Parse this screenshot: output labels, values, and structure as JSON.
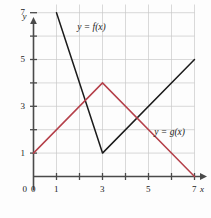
{
  "chart_data": {
    "type": "line",
    "title": "",
    "xlabel": "x",
    "ylabel": "y",
    "xlim": [
      0,
      7
    ],
    "ylim": [
      0,
      7
    ],
    "grid": true,
    "legend": "inline-labels",
    "x_ticks": [
      0,
      1,
      2,
      3,
      4,
      5,
      6,
      7
    ],
    "x_tick_labels": [
      "0",
      "1",
      "",
      "3",
      "",
      "5",
      "",
      "7"
    ],
    "y_ticks": [
      1,
      2,
      3,
      4,
      5,
      6,
      7
    ],
    "y_tick_labels": [
      "1",
      "",
      "3",
      "",
      "5",
      "",
      "7"
    ],
    "series": [
      {
        "name": "y = f(x)",
        "color": "#1b1b1b",
        "points": [
          [
            1,
            7
          ],
          [
            3,
            1
          ],
          [
            7,
            5
          ]
        ]
      },
      {
        "name": "y = g(x)",
        "color": "#b5404a",
        "points": [
          [
            0,
            1
          ],
          [
            3,
            4
          ],
          [
            7,
            0
          ]
        ]
      }
    ],
    "annotations": [
      {
        "text": "y = f(x)",
        "x": 1.9,
        "y": 6.35
      },
      {
        "text": "y = g(x)",
        "x": 5.25,
        "y": 1.85
      }
    ]
  },
  "axes": {
    "x_axis_name": "x",
    "y_axis_name": "y",
    "origin_label": "0"
  },
  "colors": {
    "f_curve": "#1b1b1b",
    "g_curve": "#b5404a",
    "grid": "#c9c9c9",
    "axis": "#4a4a4a",
    "background": "#fdfdfd"
  }
}
